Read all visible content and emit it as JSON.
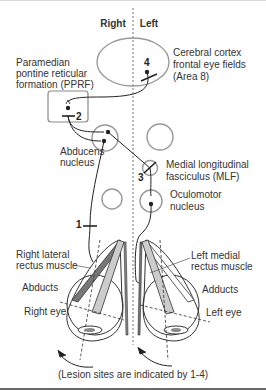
{
  "header": {
    "right": "Right",
    "left": "Left"
  },
  "labels": {
    "cortex": [
      "Cerebral cortex",
      "frontal eye fields",
      "(Area 8)"
    ],
    "pprf": [
      "Paramedian",
      "pontine reticular",
      "formation (PPRF)"
    ],
    "abducens": [
      "Abducens",
      "nucleus"
    ],
    "mlf": [
      "Medial longitudinal",
      "fasciculus (MLF)"
    ],
    "oculomotor": [
      "Oculomotor",
      "nucleus"
    ],
    "right_muscle": [
      "Right lateral",
      "rectus muscle"
    ],
    "left_muscle": [
      "Left medial",
      "rectus muscle"
    ],
    "right_action": "Abducts",
    "left_action": "Adducts",
    "right_eye": "Right eye",
    "left_eye": "Left eye",
    "caption": "(Lesion sites are indicated by 1-4)"
  },
  "lesions": {
    "l1": "1",
    "l2": "2",
    "l3": "3",
    "l4": "4"
  },
  "colors": {
    "line": "#333333",
    "circle": "#999999",
    "muscle_dark": "#777777",
    "muscle_light": "#cccccc"
  }
}
